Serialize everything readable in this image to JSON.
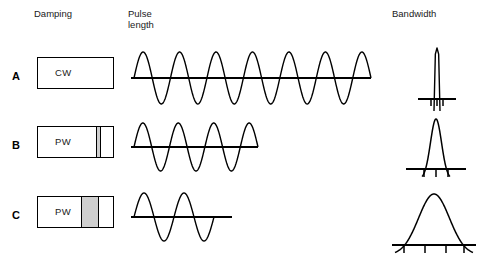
{
  "headers": {
    "damping": "Damping",
    "pulse_length": "Pulse\nlength",
    "bandwidth": "Bandwidth"
  },
  "colors": {
    "line": "#000000",
    "damping_material": "#cfcfcf",
    "crystal": "#ffffff",
    "text": "#1a1a1a"
  },
  "rows": [
    {
      "label": "A",
      "damping": {
        "mode_label": "CW",
        "box": {
          "x": 37,
          "y": 57,
          "w": 77,
          "h": 32
        },
        "damping_strip": null
      },
      "pulse": {
        "baseline": {
          "x1": 131,
          "y": 78,
          "x2": 371
        },
        "cycles": 6.5,
        "amplitude": 26,
        "wave_start": 134,
        "wave_end": 371,
        "stroke_width": 1.4
      },
      "bandwidth": {
        "baseline": {
          "x1": 418,
          "y": 99,
          "x2": 456
        },
        "peak_x": 437,
        "peak_y": 48,
        "half_width": 3,
        "shape": "spike",
        "ticks": [
          431,
          437,
          443
        ],
        "tick_len": 7,
        "stroke_width": 1.4
      }
    },
    {
      "label": "B",
      "damping": {
        "mode_label": "PW",
        "box": {
          "x": 37,
          "y": 126,
          "w": 77,
          "h": 32
        },
        "damping_strip": {
          "x": 97,
          "w": 5
        }
      },
      "pulse": {
        "baseline": {
          "x1": 131,
          "y": 147,
          "x2": 258
        },
        "cycles": 3.5,
        "amplitude": 24,
        "wave_start": 134,
        "wave_end": 258,
        "stroke_width": 1.4
      },
      "bandwidth": {
        "baseline": {
          "x1": 406,
          "y": 169,
          "x2": 466
        },
        "peak_x": 436,
        "peak_y": 119,
        "half_width": 14,
        "shape": "bell",
        "ticks": [
          424,
          436,
          448
        ],
        "tick_len": 8,
        "stroke_width": 1.5
      }
    },
    {
      "label": "C",
      "damping": {
        "mode_label": "PW",
        "box": {
          "x": 37,
          "y": 196,
          "w": 77,
          "h": 32
        },
        "damping_strip": {
          "x": 82,
          "w": 18
        }
      },
      "pulse": {
        "baseline": {
          "x1": 131,
          "y": 217,
          "x2": 232
        },
        "cycles": 2.0,
        "amplitude": 24,
        "wave_start": 134,
        "wave_end": 214,
        "stroke_width": 1.4
      },
      "bandwidth": {
        "baseline": {
          "x1": 392,
          "y": 245,
          "x2": 476
        },
        "peak_x": 434,
        "peak_y": 194,
        "half_width": 39,
        "shape": "bell",
        "ticks": [
          404,
          425,
          446,
          464
        ],
        "tick_len": 8,
        "stroke_width": 1.5
      }
    }
  ]
}
